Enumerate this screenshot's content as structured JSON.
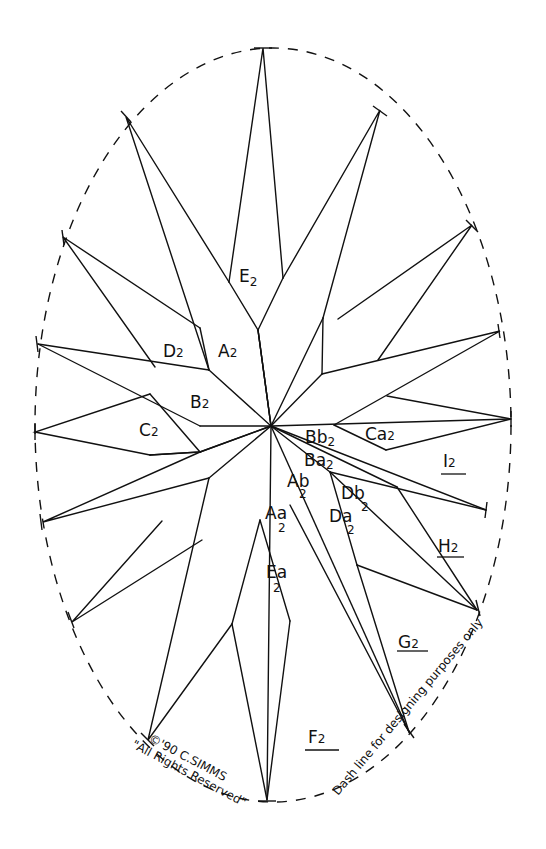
{
  "diagram": {
    "colors": {
      "ink": "#111111",
      "paper": "#ffffff"
    },
    "labels": {
      "E2": "E",
      "A2": "A",
      "D2": "D",
      "B2": "B",
      "C2": "C",
      "Bb2": "Bb",
      "Ca2": "Ca",
      "Ba2": "Ba",
      "Ab2": "Ab",
      "Db2": "Db",
      "Da2": "Da",
      "Aa2": "Aa",
      "Ea2": "Ea",
      "I2": "I",
      "H2": "H",
      "G2": "G",
      "F2": "F",
      "sub": "2"
    },
    "copyright": "©'90 C.SIMMS",
    "rights": "\"All Rights Reserved\"",
    "dash_note": "Dash line for designing purposes only"
  }
}
